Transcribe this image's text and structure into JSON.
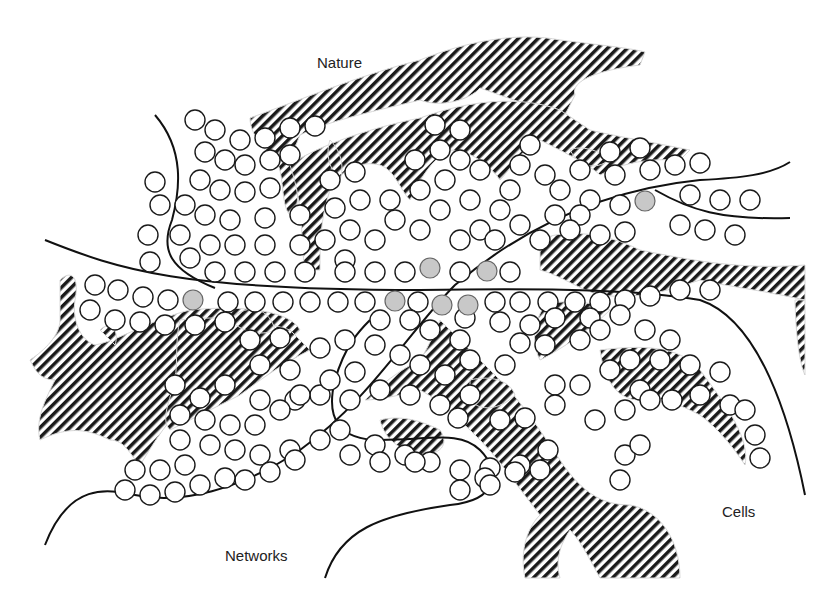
{
  "diagram": {
    "labels": {
      "nature": "Nature",
      "cells": "Cells",
      "networks": "Networks"
    },
    "colors": {
      "background": "#ffffff",
      "stroke": "#1a1a1a",
      "cell_fill": "#ffffff",
      "highlight_cell_fill": "#c8c8c8",
      "hatch": "#1a1a1a"
    },
    "legend_semantics": {
      "hatched_regions": "nature",
      "circles": "cells",
      "curves": "networks",
      "gray_circles": "highlighted cells"
    },
    "highlighted_cells": [
      [
        193,
        300
      ],
      [
        395,
        301
      ],
      [
        442,
        305
      ],
      [
        468,
        305
      ],
      [
        430,
        268
      ],
      [
        487,
        271
      ],
      [
        645,
        201
      ]
    ]
  }
}
